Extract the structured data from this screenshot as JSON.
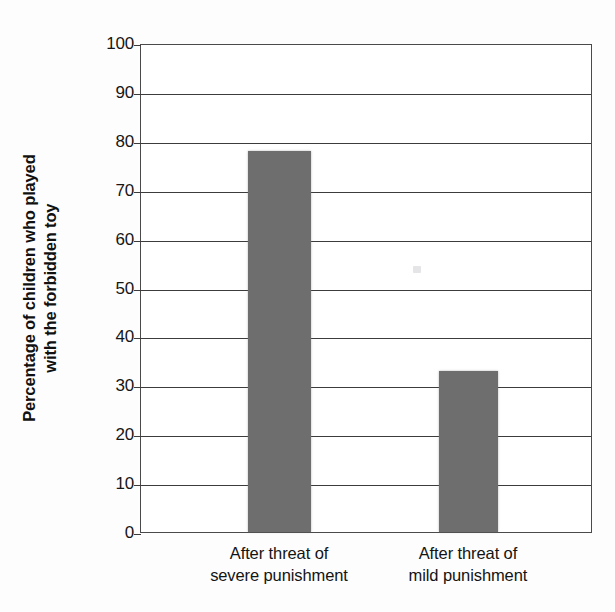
{
  "chart_data": {
    "type": "bar",
    "title": "",
    "xlabel": "",
    "ylabel_lines": [
      "Percentage of children who played",
      "with the forbidden toy"
    ],
    "ylabel": "Percentage of children who played with the forbidden toy",
    "categories": [
      "After threat of severe punishment",
      "After threat of mild punishment"
    ],
    "category_lines": [
      [
        "After threat of",
        "severe punishment"
      ],
      [
        "After threat of",
        "mild punishment"
      ]
    ],
    "values": [
      78,
      33
    ],
    "ylim": [
      0,
      100
    ],
    "ytick_values": [
      0,
      10,
      20,
      30,
      40,
      50,
      60,
      70,
      80,
      90,
      100
    ],
    "ytick_labels": [
      "0",
      "10",
      "20",
      "30",
      "40",
      "50",
      "60",
      "70",
      "80",
      "90",
      "100"
    ],
    "grid": true,
    "legend": false,
    "bar_color": "#6e6e6e",
    "axis_color": "#3c3c3c",
    "background_color": "#ffffff"
  }
}
